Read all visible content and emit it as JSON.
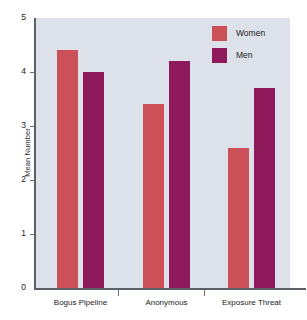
{
  "chart_data": {
    "type": "bar",
    "title": "",
    "subtitle": "",
    "xlabel": "",
    "ylabel": "Mean Number",
    "categories": [
      "Bogus Pipeline",
      "Anonymous",
      "Exposure Threat"
    ],
    "series": [
      {
        "name": "Women",
        "color": "#cc5058",
        "values": [
          4.4,
          3.4,
          2.6
        ]
      },
      {
        "name": "Men",
        "color": "#8e1a5c",
        "values": [
          4.0,
          4.2,
          3.7
        ]
      }
    ],
    "ylim": [
      0,
      5
    ],
    "yticks": [
      0,
      1,
      2,
      3,
      4,
      5
    ],
    "ytick_labels": [
      "0",
      "1",
      "2",
      "3",
      "4",
      "5"
    ],
    "grid": false,
    "legend_position": "top-right",
    "plot_background": "#dde2ea",
    "figure_background": "#ffffff",
    "axis_color": "#5a5f68"
  },
  "axis": {
    "y_title": "Mean Number",
    "y_ticks": [
      "5",
      "4",
      "3",
      "2",
      "1",
      "0"
    ],
    "x_categories": [
      "Bogus Pipeline",
      "Anonymous",
      "Exposure Threat"
    ]
  },
  "legend": {
    "items": [
      {
        "label": "Women",
        "color": "#cc5058"
      },
      {
        "label": "Men",
        "color": "#8e1a5c"
      }
    ]
  }
}
